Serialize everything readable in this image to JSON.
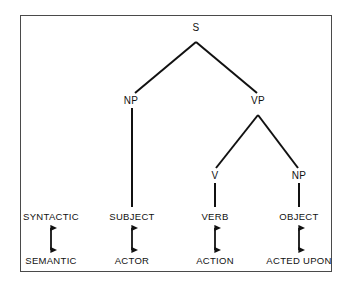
{
  "diagram": {
    "frame": {
      "border_color": "#4a4a4a"
    },
    "line_color": "#111111",
    "text_color": "#111111",
    "tree_nodes": [
      {
        "id": "s",
        "label": "S",
        "x": 196,
        "y": 27
      },
      {
        "id": "np1",
        "label": "NP",
        "x": 131,
        "y": 100
      },
      {
        "id": "vp",
        "label": "VP",
        "x": 258,
        "y": 100
      },
      {
        "id": "v",
        "label": "V",
        "x": 215,
        "y": 175
      },
      {
        "id": "np2",
        "label": "NP",
        "x": 299,
        "y": 175
      }
    ],
    "row_labels": {
      "syntactic": "SYNTACTIC",
      "semantic": "SEMANTIC"
    },
    "columns": [
      {
        "id": "legend",
        "x": 51,
        "syntactic": "SYNTACTIC",
        "semantic": "SEMANTIC",
        "has_tree_link": false,
        "has_arrow": true
      },
      {
        "id": "subject",
        "x": 132,
        "syntactic": "SUBJECT",
        "semantic": "ACTOR",
        "has_tree_link": true,
        "has_arrow": true
      },
      {
        "id": "verb",
        "x": 215,
        "syntactic": "VERB",
        "semantic": "ACTION",
        "has_tree_link": true,
        "has_arrow": true
      },
      {
        "id": "object",
        "x": 299,
        "syntactic": "OBJECT",
        "semantic": "ACTED UPON",
        "has_tree_link": true,
        "has_arrow": true
      }
    ],
    "rows": {
      "syntactic_y": 216,
      "semantic_y": 260
    }
  }
}
